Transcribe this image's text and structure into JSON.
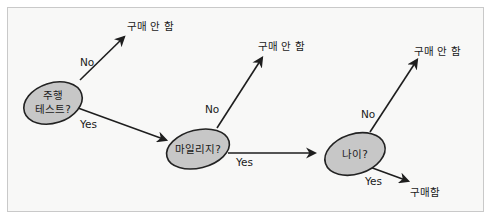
{
  "diagram": {
    "type": "decision-tree",
    "nodes": [
      {
        "id": "test_drive",
        "line1": "주행",
        "line2": "테스트?"
      },
      {
        "id": "mileage",
        "label": "마일리지?"
      },
      {
        "id": "age",
        "label": "나이?"
      }
    ],
    "outcomes": {
      "no_buy_1": "구매 안 함",
      "no_buy_2": "구매 안 함",
      "no_buy_3": "구매 안 함",
      "buy": "구매함"
    },
    "edges": {
      "test_drive_no": "No",
      "test_drive_yes": "Yes",
      "mileage_no": "No",
      "mileage_yes": "Yes",
      "age_no": "No",
      "age_yes": "Yes"
    },
    "colors": {
      "node_fill": "#c7c7c7",
      "stroke": "#1e1e1e",
      "background": "#f8f8f7",
      "border": "#c9c9c9"
    }
  }
}
